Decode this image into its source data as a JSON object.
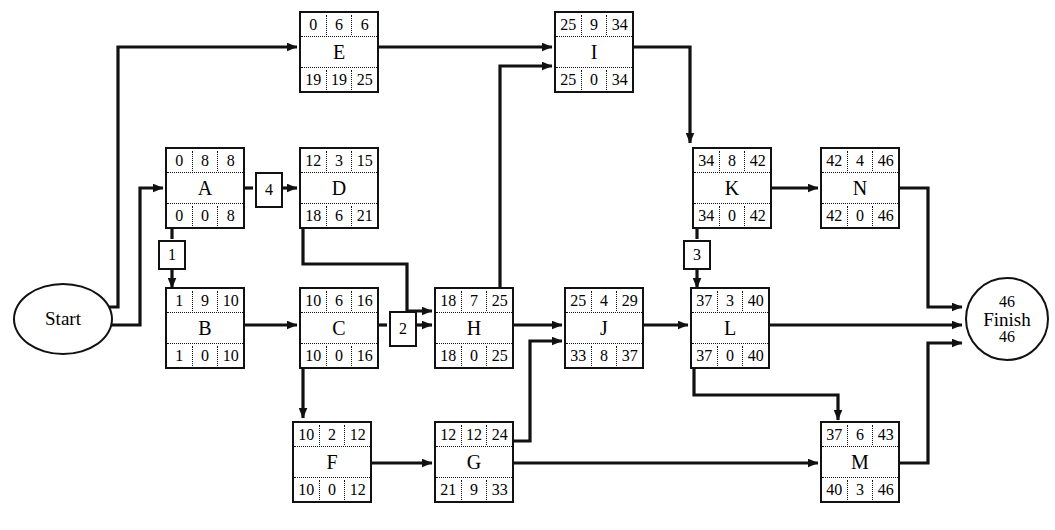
{
  "diagram": {
    "type": "pert-cpm-network",
    "title": "",
    "start_node": {
      "id": "Start",
      "label": "Start"
    },
    "finish_node": {
      "id": "Finish",
      "label": "Finish",
      "top_value": "46",
      "bottom_value": "46"
    },
    "legend": {
      "cell_order_top": [
        "early_start",
        "duration",
        "early_finish"
      ],
      "cell_order_bottom": [
        "late_start",
        "slack",
        "late_finish"
      ]
    },
    "nodes": [
      {
        "id": "E",
        "label": "E",
        "es": "0",
        "dur": "6",
        "ef": "6",
        "ls": "19",
        "slack": "19",
        "lf": "25",
        "critical": false
      },
      {
        "id": "I",
        "label": "I",
        "es": "25",
        "dur": "9",
        "ef": "34",
        "ls": "25",
        "slack": "0",
        "lf": "34",
        "critical": true
      },
      {
        "id": "A",
        "label": "A",
        "es": "0",
        "dur": "8",
        "ef": "8",
        "ls": "0",
        "slack": "0",
        "lf": "8",
        "critical": true
      },
      {
        "id": "D",
        "label": "D",
        "es": "12",
        "dur": "3",
        "ef": "15",
        "ls": "18",
        "slack": "6",
        "lf": "21",
        "critical": false
      },
      {
        "id": "K",
        "label": "K",
        "es": "34",
        "dur": "8",
        "ef": "42",
        "ls": "34",
        "slack": "0",
        "lf": "42",
        "critical": true
      },
      {
        "id": "N",
        "label": "N",
        "es": "42",
        "dur": "4",
        "ef": "46",
        "ls": "42",
        "slack": "0",
        "lf": "46",
        "critical": true
      },
      {
        "id": "B",
        "label": "B",
        "es": "1",
        "dur": "9",
        "ef": "10",
        "ls": "1",
        "slack": "0",
        "lf": "10",
        "critical": true
      },
      {
        "id": "C",
        "label": "C",
        "es": "10",
        "dur": "6",
        "ef": "16",
        "ls": "10",
        "slack": "0",
        "lf": "16",
        "critical": true
      },
      {
        "id": "H",
        "label": "H",
        "es": "18",
        "dur": "7",
        "ef": "25",
        "ls": "18",
        "slack": "0",
        "lf": "25",
        "critical": true
      },
      {
        "id": "J",
        "label": "J",
        "es": "25",
        "dur": "4",
        "ef": "29",
        "ls": "33",
        "slack": "8",
        "lf": "37",
        "critical": false
      },
      {
        "id": "L",
        "label": "L",
        "es": "37",
        "dur": "3",
        "ef": "40",
        "ls": "37",
        "slack": "0",
        "lf": "40",
        "critical": true
      },
      {
        "id": "F",
        "label": "F",
        "es": "10",
        "dur": "2",
        "ef": "12",
        "ls": "10",
        "slack": "0",
        "lf": "12",
        "critical": true
      },
      {
        "id": "G",
        "label": "G",
        "es": "12",
        "dur": "12",
        "ef": "24",
        "ls": "21",
        "slack": "9",
        "lf": "33",
        "critical": false
      },
      {
        "id": "M",
        "label": "M",
        "es": "37",
        "dur": "6",
        "ef": "43",
        "ls": "40",
        "slack": "3",
        "lf": "46",
        "critical": false
      }
    ],
    "edge_labels": [
      {
        "id": "lag-A-B",
        "value": "1"
      },
      {
        "id": "lag-A-D",
        "value": "4"
      },
      {
        "id": "lag-C-H",
        "value": "2"
      },
      {
        "id": "lag-K-L",
        "value": "3"
      }
    ],
    "edges": [
      {
        "from": "Start",
        "to": "E"
      },
      {
        "from": "Start",
        "to": "A"
      },
      {
        "from": "A",
        "to": "D"
      },
      {
        "from": "A",
        "to": "B"
      },
      {
        "from": "B",
        "to": "C"
      },
      {
        "from": "C",
        "to": "H"
      },
      {
        "from": "C",
        "to": "F"
      },
      {
        "from": "D",
        "to": "H"
      },
      {
        "from": "E",
        "to": "I"
      },
      {
        "from": "H",
        "to": "I"
      },
      {
        "from": "H",
        "to": "J"
      },
      {
        "from": "F",
        "to": "G"
      },
      {
        "from": "G",
        "to": "J"
      },
      {
        "from": "G",
        "to": "M"
      },
      {
        "from": "I",
        "to": "K"
      },
      {
        "from": "J",
        "to": "L"
      },
      {
        "from": "K",
        "to": "N"
      },
      {
        "from": "K",
        "to": "L"
      },
      {
        "from": "L",
        "to": "Finish"
      },
      {
        "from": "L",
        "to": "M"
      },
      {
        "from": "N",
        "to": "Finish"
      },
      {
        "from": "M",
        "to": "Finish"
      }
    ],
    "colors": {
      "line": "#111111",
      "box_fill": "#ffffff",
      "text": "#000000"
    }
  }
}
